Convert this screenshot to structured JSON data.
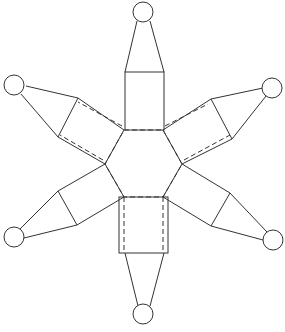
{
  "diagram": {
    "title": "",
    "line_color": "#333333",
    "background": "#ffffff",
    "hexagon": [
      [
        124,
        130
      ],
      [
        163,
        130
      ],
      [
        182,
        164
      ],
      [
        163,
        197
      ],
      [
        124,
        197
      ],
      [
        105,
        164
      ]
    ],
    "arm_count": 6
  }
}
